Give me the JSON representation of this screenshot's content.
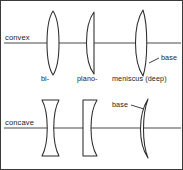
{
  "figure": {
    "border_color": "#3a3a3a",
    "background": "#ffffff",
    "line_color": "#2b2b2b",
    "axis_color": "#4a4a4a"
  },
  "rows": [
    {
      "id": "convex-row",
      "label": "convex",
      "axis_y": 42,
      "lenses": [
        {
          "id": "biconvex",
          "type_label": "bi-"
        },
        {
          "id": "plano-convex",
          "type_label": "plano-"
        },
        {
          "id": "meniscus-convex",
          "type_label": "meniscus (deep)"
        }
      ],
      "callout": {
        "label": "base",
        "target": "meniscus-convex"
      }
    },
    {
      "id": "concave-row",
      "label": "concave",
      "axis_y": 127,
      "lenses": [
        {
          "id": "biconcave",
          "type_label": "bi-"
        },
        {
          "id": "plano-concave",
          "type_label": "plano-"
        },
        {
          "id": "meniscus-concave",
          "type_label": "meniscus (deep)"
        }
      ],
      "callout": {
        "label": "base",
        "target": "meniscus-concave"
      }
    }
  ],
  "type_captions": {
    "bi": "bi-",
    "plano": "plano-",
    "meniscus": "meniscus (deep)"
  }
}
